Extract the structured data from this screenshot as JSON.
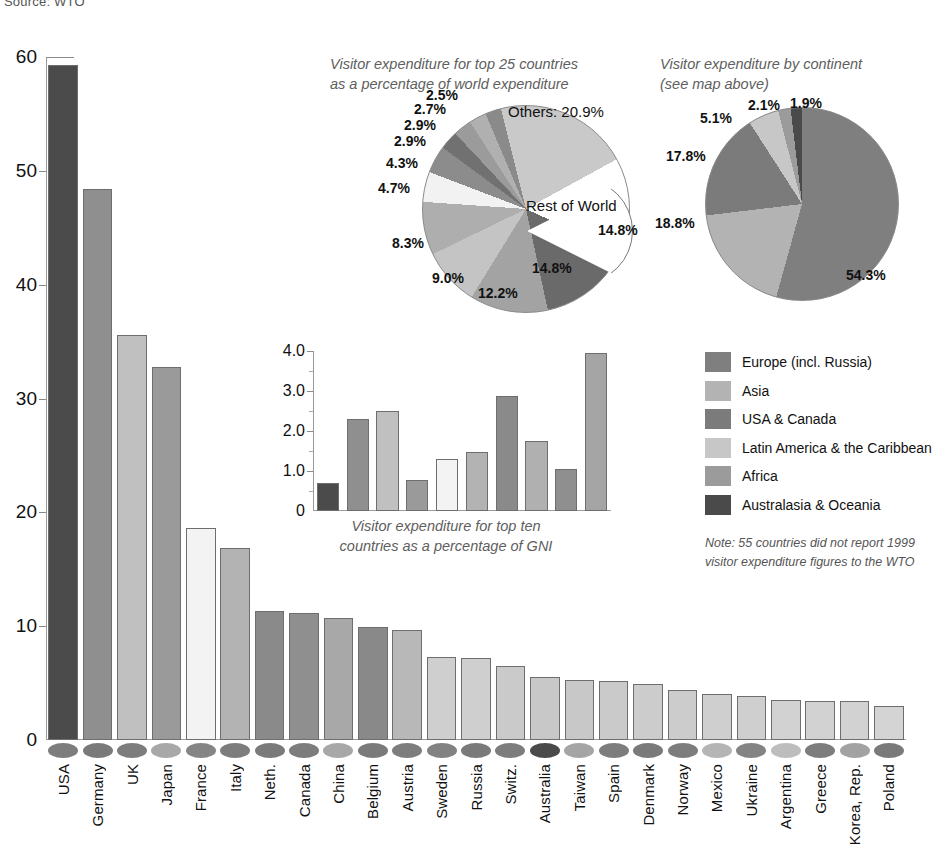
{
  "source_note": "Source: WTO",
  "chart_data": [
    {
      "type": "bar",
      "name": "main-bar-chart",
      "title": "",
      "xlabel": "",
      "ylabel": "",
      "ylim": [
        0,
        60
      ],
      "yticks": [
        "0",
        "10",
        "20",
        "30",
        "40",
        "50",
        "60"
      ],
      "grid": false,
      "categories": [
        "USA",
        "Germany",
        "UK",
        "Japan",
        "France",
        "Italy",
        "Neth.",
        "Canada",
        "China",
        "Belgium",
        "Austria",
        "Sweden",
        "Russia",
        "Switz.",
        "Australia",
        "Taiwan",
        "Spain",
        "Denmark",
        "Norway",
        "Mexico",
        "Ukraine",
        "Argentina",
        "Greece",
        "Korea, Rep.",
        "Poland"
      ],
      "values": [
        59.3,
        48.4,
        35.6,
        32.8,
        18.6,
        16.9,
        11.3,
        11.2,
        10.7,
        9.9,
        9.7,
        7.3,
        7.2,
        6.5,
        5.5,
        5.3,
        5.2,
        4.9,
        4.4,
        4.0,
        3.9,
        3.5,
        3.4,
        3.4,
        3.0
      ],
      "bar_colors": [
        "#4b4b4b",
        "#8f8f8f",
        "#c0c0c0",
        "#9a9a9a",
        "#f3f3f3",
        "#b3b3b3",
        "#8a8a8a",
        "#8f8f8f",
        "#a8a8a8",
        "#898989",
        "#b8b8b8",
        "#cfcfcf",
        "#cfcfcf",
        "#cacaca",
        "#c8c8c8",
        "#c8c8c8",
        "#cacaca",
        "#cccccc",
        "#cccccc",
        "#cfcfcf",
        "#cfcfcf",
        "#d2d2d2",
        "#d2d2d2",
        "#d2d2d2",
        "#d4d4d4"
      ],
      "dot_colors": [
        "#7d7d7d",
        "#7a7a7a",
        "#7d7d7d",
        "#a8a8a8",
        "#858585",
        "#7d7d7d",
        "#7a7a7a",
        "#7d7d7d",
        "#a8a8a8",
        "#7a7a7a",
        "#7d7d7d",
        "#828282",
        "#7a7a7a",
        "#7d7d7d",
        "#4a4a4a",
        "#a5a5a5",
        "#7d7d7d",
        "#7a7a7a",
        "#7d7d7d",
        "#b5b5b5",
        "#848484",
        "#bdbdbd",
        "#7d7d7d",
        "#a2a2a2",
        "#7a7a7a"
      ]
    },
    {
      "type": "pie",
      "name": "top25-share-pie",
      "title": "Visitor expenditure for top 25 countries\nas a percentage of world expenditure",
      "title_line1": "Visitor expenditure for top 25 countries",
      "title_line2": "as a percentage of world expenditure",
      "inner_labels": [
        "Others:  20.9%",
        "Rest of World"
      ],
      "others_label": "Others:  20.9%",
      "rest_of_world_label": "Rest of World",
      "labels": [
        "Others",
        "Rest of World",
        "USA",
        "Germany",
        "UK",
        "Japan",
        "France",
        "Italy",
        "Neth.",
        "Canada",
        "China",
        "Belgium"
      ],
      "values": [
        20.9,
        14.8,
        14.8,
        12.2,
        9.0,
        8.3,
        4.7,
        4.3,
        2.9,
        2.9,
        2.7,
        2.5
      ],
      "value_labels": [
        "20.9%",
        "14.8%",
        "14.8%",
        "12.2%",
        "9.0%",
        "8.3%",
        "4.7%",
        "4.3%",
        "2.9%",
        "2.9%",
        "2.7%",
        "2.5%"
      ],
      "slice_colors": [
        "#c9c9c9",
        "#ffffff",
        "#6a6a6a",
        "#a3a3a3",
        "#c4c4c4",
        "#aeaeae",
        "#f2f2f2",
        "#8c8c8c",
        "#717171",
        "#9b9b9b",
        "#b0b0b0",
        "#8a8a8a"
      ]
    },
    {
      "type": "pie",
      "name": "continent-share-pie",
      "title_line1": "Visitor expenditure by continent",
      "title_line2": "(see map above)",
      "labels": [
        "Europe (incl. Russia)",
        "Asia",
        "USA & Canada",
        "Latin America & the Caribbean",
        "Africa",
        "Australasia & Oceania"
      ],
      "values": [
        54.3,
        18.8,
        17.8,
        5.1,
        2.1,
        1.9
      ],
      "value_labels": [
        "54.3%",
        "18.8%",
        "17.8%",
        "5.1%",
        "2.1%",
        "1.9%"
      ],
      "slice_colors": [
        "#7f7f7f",
        "#b3b3b3",
        "#7b7b7b",
        "#c7c7c7",
        "#9b9b9b",
        "#4a4a4a"
      ]
    },
    {
      "type": "bar",
      "name": "gni-inset-bar-chart",
      "title_line1": "Visitor expenditure for top ten",
      "title_line2": "countries as a percentage of GNI",
      "ylim": [
        0,
        4.0
      ],
      "yticks": [
        "0",
        "1.0",
        "2.0",
        "3.0",
        "4.0"
      ],
      "categories": [
        "USA",
        "Germany",
        "UK",
        "Japan",
        "France",
        "Italy",
        "Neth.",
        "Canada",
        "China",
        "Belgium"
      ],
      "values": [
        0.7,
        2.3,
        2.5,
        0.78,
        1.3,
        1.48,
        2.88,
        1.75,
        1.05,
        3.95
      ],
      "bar_colors": [
        "#4b4b4b",
        "#8f8f8f",
        "#c0c0c0",
        "#9a9a9a",
        "#f3f3f3",
        "#b3b3b3",
        "#8a8a8a",
        "#b0b0b0",
        "#8f8f8f",
        "#a5a5a5"
      ]
    }
  ],
  "legend": {
    "items": [
      {
        "label": "Europe (incl. Russia)",
        "color": "#7f7f7f"
      },
      {
        "label": "Asia",
        "color": "#b3b3b3"
      },
      {
        "label": "USA & Canada",
        "color": "#7b7b7b"
      },
      {
        "label": "Latin America & the Caribbean",
        "color": "#c7c7c7"
      },
      {
        "label": "Africa",
        "color": "#9b9b9b"
      },
      {
        "label": "Australasia & Oceania",
        "color": "#4a4a4a"
      }
    ],
    "note_line1": "Note: 55 countries did not report 1999",
    "note_line2": "visitor expenditure figures to the WTO"
  }
}
